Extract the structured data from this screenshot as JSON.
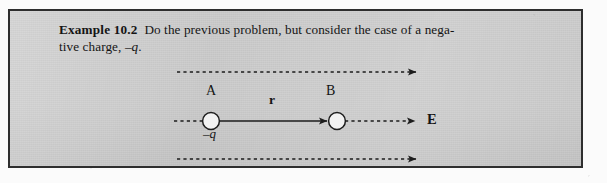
{
  "example": {
    "label": "Example 10.2",
    "body_line_1": "Do the previous problem, but consider the case of a nega-",
    "body_line_2_prefix": "tive charge, ",
    "body_line_2_charge": "–q",
    "body_line_2_suffix": "."
  },
  "figure": {
    "name": "electric-field-negative-charge-diagram",
    "charge_a_label": "A",
    "charge_b_label": "B",
    "distance_label": "r",
    "field_label": "E",
    "charge_value_label": "–q",
    "field_lines": [
      {
        "name": "field-line-top",
        "style": "dashed",
        "arrow": "right"
      },
      {
        "name": "field-line-middle",
        "style": "dashed",
        "arrow": "right"
      },
      {
        "name": "field-line-bottom",
        "style": "dashed",
        "arrow": "right"
      }
    ],
    "separation_arrow": {
      "name": "separation-arrow-r",
      "style": "solid",
      "arrow": "right"
    }
  },
  "colors": {
    "panel_background": "#c9c9c9",
    "panel_border": "#2e2e2e",
    "ink": "#141414",
    "page_background": "#ffffff",
    "charge_fill": "#f2f2f2"
  }
}
